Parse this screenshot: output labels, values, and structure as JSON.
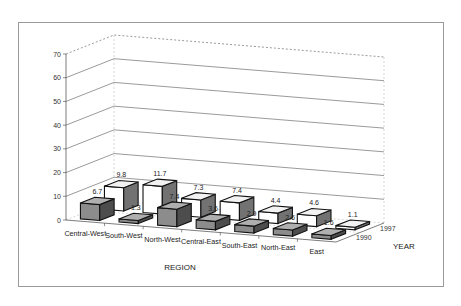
{
  "chart_data": {
    "type": "bar",
    "subtype": "3d-clustered-depth",
    "title": "",
    "xlabel": "REGION",
    "ylabel": "",
    "zlabel": "YEAR",
    "ylim": [
      0,
      70
    ],
    "yticks": [
      0,
      10,
      20,
      30,
      40,
      50,
      60,
      70
    ],
    "grid": true,
    "legend": "none",
    "categories": [
      "Central-West",
      "South-West",
      "North-West",
      "Central-East",
      "South-East",
      "North-East",
      "East"
    ],
    "series": [
      {
        "name": "1990",
        "values": [
          6.7,
          1.3,
          7.4,
          3.6,
          2.9,
          2.6,
          1.6
        ],
        "color": "#8c8c8c"
      },
      {
        "name": "1997",
        "values": [
          9.8,
          11.7,
          7.3,
          7.4,
          4.4,
          4.6,
          1.1
        ],
        "color": "#ffffff"
      }
    ],
    "value_labels": [
      "6.7",
      "1.3",
      "7.4",
      "3.6",
      "2.9",
      "2.6",
      "1.6",
      "9.8",
      "11.7",
      "7.3",
      "7.4",
      "4.4",
      "4.6",
      "1.1"
    ],
    "depth_labels": [
      "1997",
      "1990"
    ]
  }
}
